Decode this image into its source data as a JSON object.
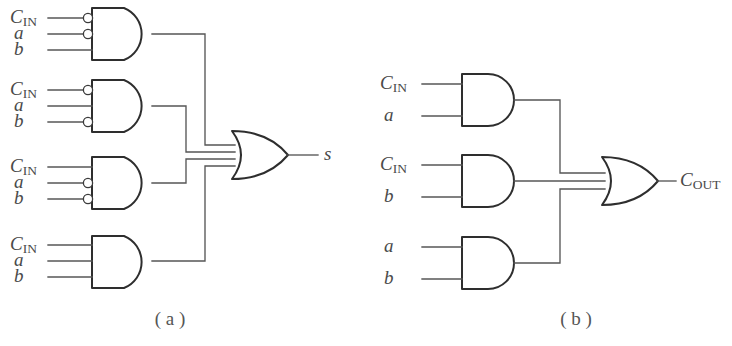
{
  "figure": {
    "background_color": "#ffffff",
    "wire_color": "#565656",
    "gate_color": "#2e2e2e",
    "label_color": "#4a4a4a"
  },
  "panels": [
    {
      "id": "panel-a",
      "caption": "( a )",
      "output_label_main": "s",
      "output_label_sub": "",
      "or_gate_inputs": 4,
      "and_gates": [
        {
          "id": "and-gate-a1",
          "inputs": [
            {
              "main": "C",
              "sub": "IN",
              "inverted": true
            },
            {
              "main": "a",
              "sub": "",
              "inverted": true
            },
            {
              "main": "b",
              "sub": "",
              "inverted": false
            }
          ]
        },
        {
          "id": "and-gate-a2",
          "inputs": [
            {
              "main": "C",
              "sub": "IN",
              "inverted": true
            },
            {
              "main": "a",
              "sub": "",
              "inverted": false
            },
            {
              "main": "b",
              "sub": "",
              "inverted": true
            }
          ]
        },
        {
          "id": "and-gate-a3",
          "inputs": [
            {
              "main": "C",
              "sub": "IN",
              "inverted": false
            },
            {
              "main": "a",
              "sub": "",
              "inverted": true
            },
            {
              "main": "b",
              "sub": "",
              "inverted": true
            }
          ]
        },
        {
          "id": "and-gate-a4",
          "inputs": [
            {
              "main": "C",
              "sub": "IN",
              "inverted": false
            },
            {
              "main": "a",
              "sub": "",
              "inverted": false
            },
            {
              "main": "b",
              "sub": "",
              "inverted": false
            }
          ]
        }
      ]
    },
    {
      "id": "panel-b",
      "caption": "( b )",
      "output_label_main": "C",
      "output_label_sub": "OUT",
      "or_gate_inputs": 3,
      "and_gates": [
        {
          "id": "and-gate-b1",
          "inputs": [
            {
              "main": "C",
              "sub": "IN",
              "inverted": false
            },
            {
              "main": "a",
              "sub": "",
              "inverted": false
            }
          ]
        },
        {
          "id": "and-gate-b2",
          "inputs": [
            {
              "main": "C",
              "sub": "IN",
              "inverted": false
            },
            {
              "main": "b",
              "sub": "",
              "inverted": false
            }
          ]
        },
        {
          "id": "and-gate-b3",
          "inputs": [
            {
              "main": "a",
              "sub": "",
              "inverted": false
            },
            {
              "main": "b",
              "sub": "",
              "inverted": false
            }
          ]
        }
      ]
    }
  ]
}
